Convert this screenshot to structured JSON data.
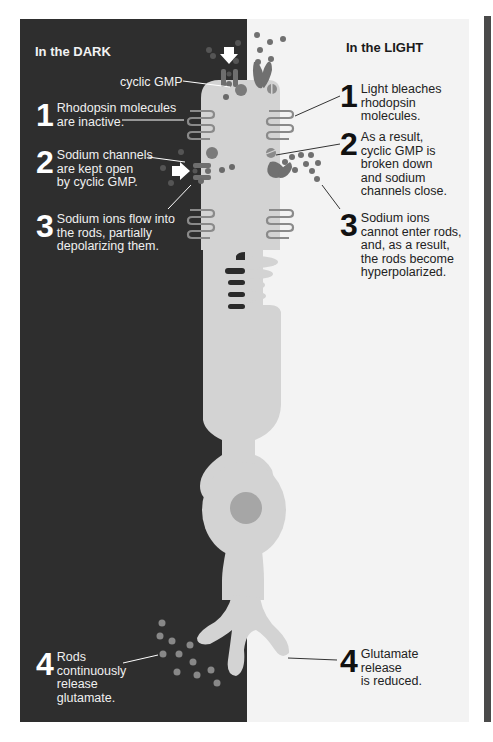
{
  "colors": {
    "dark_panel": "#2e2e2e",
    "light_panel": "#f3f3f3",
    "cell": "#d3d3d3",
    "nucleus": "#a6a6a6",
    "molecule": "#7a7a7a",
    "disc_stroke": "#8a8a8a",
    "right_bar": "#4a4a4a"
  },
  "dark": {
    "title": "In the DARK",
    "cgmp_label": "cyclic GMP",
    "steps": [
      {
        "num": "1",
        "text": "Rhodopsin molecules\nare inactive."
      },
      {
        "num": "2",
        "text": "Sodium channels\nare kept open\nby cyclic GMP."
      },
      {
        "num": "3",
        "text": "Sodium ions flow into\nthe rods, partially\ndepolarizing them."
      },
      {
        "num": "4",
        "text": "Rods\ncontinuously\nrelease\nglutamate."
      }
    ]
  },
  "light": {
    "title": "In the LIGHT",
    "steps": [
      {
        "num": "1",
        "text": "Light bleaches\nrhodopsin\nmolecules."
      },
      {
        "num": "2",
        "text": "As a result,\ncyclic GMP is\nbroken down\nand sodium\nchannels close."
      },
      {
        "num": "3",
        "text": "Sodium ions\ncannot enter rods,\nand, as a result,\nthe rods become\nhyperpolarized."
      },
      {
        "num": "4",
        "text": "Glutamate\nrelease\nis reduced."
      }
    ]
  },
  "icons": {
    "arrow": "sodium-flow-arrow",
    "channel_open": "sodium-channel-open",
    "channel_closed": "sodium-channel-closed",
    "rhodopsin": "rhodopsin-disc-stack",
    "cgmp": "cyclic-gmp-molecule",
    "glutamate": "glutamate-molecule",
    "nucleus": "nucleus"
  }
}
